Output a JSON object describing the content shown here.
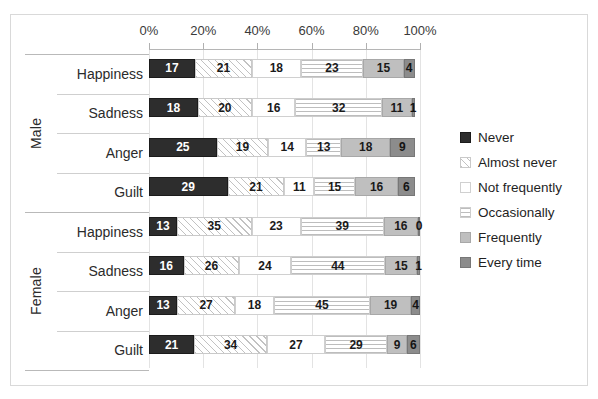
{
  "chart_data": {
    "type": "bar",
    "orientation": "horizontal",
    "stacked": true,
    "normalized_percent": true,
    "title": "",
    "xlabel": "",
    "ylabel": "",
    "xlim": [
      0,
      100
    ],
    "grid": true,
    "legend_position": "right",
    "x_tick_labels": [
      "0%",
      "20%",
      "40%",
      "60%",
      "80%",
      "100%"
    ],
    "x_tick_values": [
      0,
      20,
      40,
      60,
      80,
      100
    ],
    "groups": [
      {
        "name": "Male",
        "categories": [
          "Happiness",
          "Sadness",
          "Anger",
          "Guilt"
        ]
      },
      {
        "name": "Female",
        "categories": [
          "Happiness",
          "Sadness",
          "Anger",
          "Guilt"
        ]
      }
    ],
    "categories": [
      "Male / Happiness",
      "Male / Sadness",
      "Male / Anger",
      "Male / Guilt",
      "Female / Happiness",
      "Female / Sadness",
      "Female / Anger",
      "Female / Guilt"
    ],
    "series": [
      {
        "name": "Never",
        "values": [
          17,
          18,
          25,
          29,
          13,
          16,
          13,
          21
        ]
      },
      {
        "name": "Almost never",
        "values": [
          21,
          20,
          19,
          21,
          35,
          26,
          27,
          34
        ]
      },
      {
        "name": "Not frequently",
        "values": [
          18,
          16,
          14,
          11,
          23,
          24,
          18,
          27
        ]
      },
      {
        "name": "Occasionally",
        "values": [
          23,
          32,
          13,
          15,
          39,
          44,
          45,
          29
        ]
      },
      {
        "name": "Frequently",
        "values": [
          15,
          11,
          18,
          16,
          16,
          15,
          19,
          9
        ]
      },
      {
        "name": "Every time",
        "values": [
          4,
          1,
          9,
          6,
          0,
          1,
          4,
          6
        ]
      }
    ]
  },
  "legend": {
    "items": [
      {
        "label": "Never",
        "pattern": "solid-dark",
        "color": "#2d2d2d"
      },
      {
        "label": "Almost never",
        "pattern": "diagonal-hatch",
        "color": "#c2c2c2"
      },
      {
        "label": "Not frequently",
        "pattern": "fine-dots",
        "color": "#c9c9c9"
      },
      {
        "label": "Occasionally",
        "pattern": "horizontal-dash",
        "color": "#bdbdbd"
      },
      {
        "label": "Frequently",
        "pattern": "solid-light-gray",
        "color": "#bfbfbf"
      },
      {
        "label": "Every time",
        "pattern": "solid-mid-gray",
        "color": "#8c8c8c"
      }
    ]
  }
}
